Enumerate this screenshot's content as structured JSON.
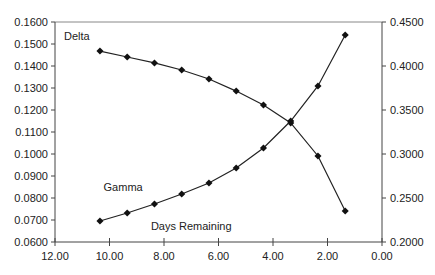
{
  "chart_data": {
    "type": "line",
    "title": "",
    "xlabel": "Days Remaining",
    "ylabel_left": "",
    "ylabel_right": "",
    "x_reversed": true,
    "xlim": [
      12,
      0
    ],
    "ylim_left": [
      0.06,
      0.16
    ],
    "ylim_right": [
      0.2,
      0.45
    ],
    "grid": false,
    "legend": "inline labels",
    "x_ticks": [
      "12.00",
      "10.00",
      "8.00",
      "6.00",
      "4.00",
      "2.00",
      "0.00"
    ],
    "y_left_ticks": [
      "0.0600",
      "0.0700",
      "0.0800",
      "0.0900",
      "0.1000",
      "0.1100",
      "0.1200",
      "0.1300",
      "0.1400",
      "0.1500",
      "0.1600"
    ],
    "y_right_ticks": [
      "0.2000",
      "0.2500",
      "0.3000",
      "0.3500",
      "0.4000",
      "0.4500"
    ],
    "x": [
      10.35,
      9.35,
      8.35,
      7.35,
      6.35,
      5.35,
      4.35,
      3.35,
      2.35,
      1.35
    ],
    "series": [
      {
        "name": "Delta",
        "axis": "left",
        "values": [
          0.1468,
          0.1441,
          0.1414,
          0.1382,
          0.1341,
          0.1286,
          0.1223,
          0.1141,
          0.0991,
          0.0741
        ],
        "label_pos": [
          11.2,
          0.1517
        ]
      },
      {
        "name": "Gamma",
        "axis": "right",
        "values": [
          0.2239,
          0.233,
          0.2432,
          0.2545,
          0.267,
          0.2841,
          0.3068,
          0.3375,
          0.3773,
          0.4352
        ],
        "label_pos": [
          9.5,
          0.258
        ]
      }
    ],
    "annotations": [
      {
        "text": "Days Remaining",
        "x": 7.0,
        "y_right": 0.214
      }
    ]
  }
}
